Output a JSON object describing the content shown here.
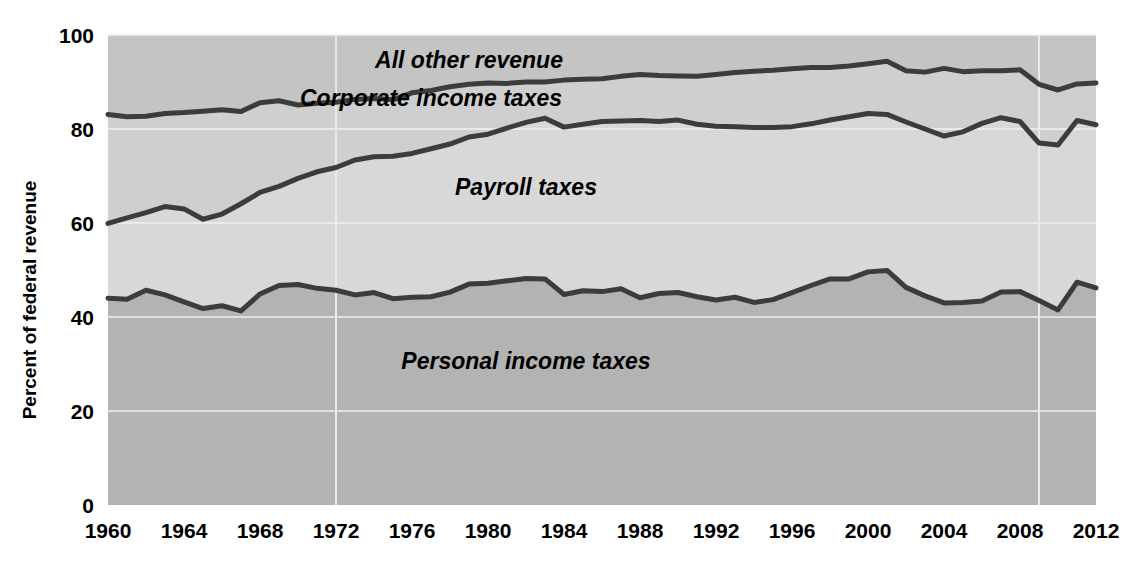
{
  "chart_data": {
    "type": "area",
    "title": "",
    "subtitle": "",
    "xlabel": "",
    "ylabel": "Percent of federal revenue",
    "ylim": [
      0,
      100
    ],
    "xlim": [
      1960,
      2012
    ],
    "grid": true,
    "grid_axis": "y",
    "legend_position": "inline-annotations",
    "stacked": true,
    "stack_order_bottom_to_top": [
      "Personal income taxes",
      "Payroll taxes",
      "Corporate income taxes",
      "All other revenue"
    ],
    "y_ticks": [
      0,
      20,
      40,
      60,
      80,
      100
    ],
    "y_tick_labels": [
      "0",
      "20",
      "40",
      "60",
      "80",
      "100"
    ],
    "x_ticks": [
      1960,
      1964,
      1968,
      1972,
      1976,
      1980,
      1984,
      1988,
      1992,
      1996,
      2000,
      2004,
      2008,
      2012
    ],
    "x_tick_labels": [
      "1960",
      "1964",
      "1968",
      "1972",
      "1976",
      "1980",
      "1984",
      "1988",
      "1992",
      "1996",
      "2000",
      "2004",
      "2008",
      "2012"
    ],
    "x": [
      1960,
      1961,
      1962,
      1963,
      1964,
      1965,
      1966,
      1967,
      1968,
      1969,
      1970,
      1971,
      1972,
      1973,
      1974,
      1975,
      1976,
      1977,
      1978,
      1979,
      1980,
      1981,
      1982,
      1983,
      1984,
      1985,
      1986,
      1987,
      1988,
      1989,
      1990,
      1991,
      1992,
      1993,
      1994,
      1995,
      1996,
      1997,
      1998,
      1999,
      2000,
      2001,
      2002,
      2003,
      2004,
      2005,
      2006,
      2007,
      2008,
      2009,
      2010,
      2011,
      2012
    ],
    "annotations": [
      {
        "text": "All other revenue",
        "x": 1979,
        "y": 93,
        "style": "bold-italic"
      },
      {
        "text": "Corporate income taxes",
        "x": 1977,
        "y": 85,
        "style": "bold-italic"
      },
      {
        "text": "Payroll taxes",
        "x": 1982,
        "y": 66,
        "style": "bold-italic"
      },
      {
        "text": "Personal income taxes",
        "x": 1982,
        "y": 29,
        "style": "bold-italic"
      }
    ],
    "boundary_lines": [
      {
        "name": "personal-income-taxes-top",
        "description": "Cumulative top of Personal income taxes band",
        "values": [
          44.0,
          43.8,
          45.7,
          44.7,
          43.2,
          41.8,
          42.4,
          41.3,
          44.9,
          46.7,
          46.9,
          46.1,
          45.7,
          44.7,
          45.2,
          43.9,
          44.2,
          44.3,
          45.3,
          47.0,
          47.2,
          47.7,
          48.2,
          48.1,
          44.8,
          45.6,
          45.4,
          46.0,
          44.1,
          45.0,
          45.2,
          44.3,
          43.6,
          44.2,
          43.1,
          43.7,
          45.2,
          46.7,
          48.1,
          48.1,
          49.6,
          49.9,
          46.3,
          44.5,
          43.0,
          43.1,
          43.4,
          45.3,
          45.4,
          43.5,
          41.5,
          47.4,
          46.2
        ]
      },
      {
        "name": "payroll-taxes-top",
        "description": "Cumulative top of Payroll taxes band (Personal + Payroll)",
        "values": [
          59.9,
          61.1,
          62.2,
          63.5,
          63.0,
          60.8,
          61.9,
          64.1,
          66.5,
          67.8,
          69.5,
          70.9,
          71.8,
          73.4,
          74.1,
          74.2,
          74.8,
          75.8,
          76.8,
          78.3,
          78.9,
          80.2,
          81.4,
          82.3,
          80.4,
          81.0,
          81.6,
          81.7,
          81.8,
          81.6,
          81.9,
          81.0,
          80.6,
          80.5,
          80.3,
          80.3,
          80.5,
          81.1,
          81.9,
          82.6,
          83.3,
          83.1,
          81.5,
          80.0,
          78.5,
          79.4,
          81.2,
          82.4,
          81.6,
          77.0,
          76.6,
          81.8,
          80.9
        ]
      },
      {
        "name": "corporate-income-taxes-top",
        "description": "Cumulative top of Corporate income taxes band (Personal + Payroll + Corporate)",
        "values": [
          83.1,
          82.6,
          82.7,
          83.3,
          83.5,
          83.8,
          84.1,
          83.7,
          85.6,
          86.0,
          85.1,
          85.5,
          85.7,
          86.3,
          86.5,
          86.2,
          87.7,
          88.2,
          89.0,
          89.5,
          89.8,
          89.7,
          90.0,
          90.0,
          90.4,
          90.6,
          90.7,
          91.2,
          91.6,
          91.4,
          91.3,
          91.2,
          91.6,
          92.0,
          92.3,
          92.5,
          92.8,
          93.1,
          93.1,
          93.4,
          93.9,
          94.4,
          92.4,
          92.1,
          92.9,
          92.2,
          92.4,
          92.4,
          92.6,
          89.5,
          88.3,
          89.6,
          89.8
        ]
      }
    ],
    "band_fill_colors": {
      "Personal income taxes": "#b3b3b3",
      "Payroll taxes": "#d8d8d8",
      "Corporate income taxes": "#cfcfcf",
      "All other revenue": "#c4c4c4"
    },
    "line_color": "#3c3c3c",
    "gridline_color": "#f0f0f0"
  },
  "axes": {
    "y_title": "Percent of federal revenue",
    "y_tick_labels": [
      "100",
      "80",
      "60",
      "40",
      "20",
      "0"
    ],
    "x_tick_labels": [
      "1960",
      "1964",
      "1968",
      "1972",
      "1976",
      "1980",
      "1984",
      "1988",
      "1992",
      "1996",
      "2000",
      "2004",
      "2008",
      "2012"
    ]
  },
  "series_labels": {
    "all_other_revenue": "All other revenue",
    "corporate_income_taxes": "Corporate income taxes",
    "payroll_taxes": "Payroll taxes",
    "personal_income_taxes": "Personal income taxes"
  }
}
